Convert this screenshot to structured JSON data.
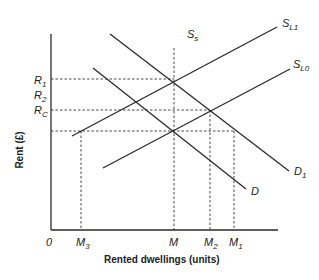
{
  "diagram": {
    "y_axis_title": "Rent (£)",
    "x_axis_title": "Rented dwellings (units)",
    "origin_label": "0",
    "y_labels": {
      "r1": {
        "main": "R",
        "sub": "1"
      },
      "r2": {
        "main": "R",
        "sub": "2"
      },
      "rc": {
        "main": "R",
        "sub": "C"
      }
    },
    "x_labels": {
      "m3": {
        "main": "M",
        "sub": "3"
      },
      "m": {
        "main": "M",
        "sub": ""
      },
      "m2": {
        "main": "M",
        "sub": "2"
      },
      "m1": {
        "main": "M",
        "sub": "1"
      }
    },
    "curves": {
      "ss": {
        "main": "S",
        "sub": "s"
      },
      "sl1": {
        "main": "S",
        "sub": "L1"
      },
      "sl0": {
        "main": "S",
        "sub": "L0"
      },
      "d": {
        "main": "D",
        "sub": ""
      },
      "d1": {
        "main": "D",
        "sub": "1"
      }
    }
  }
}
